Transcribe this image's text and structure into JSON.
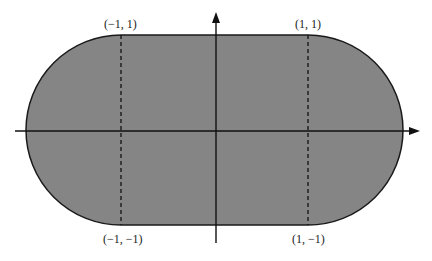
{
  "diagram": {
    "shape": "stadium",
    "fill_color": "#858585",
    "stroke_color": "#1a1a1a",
    "points": [
      {
        "id": "top-left",
        "label": "(−1, 1)",
        "x": -1,
        "y": 1
      },
      {
        "id": "top-right",
        "label": "(1, 1)",
        "x": 1,
        "y": 1
      },
      {
        "id": "bottom-left",
        "label": "(−1, −1)",
        "x": -1,
        "y": -1
      },
      {
        "id": "bottom-right",
        "label": "(1, −1)",
        "x": 1,
        "y": -1
      }
    ],
    "axes": {
      "x_arrow": true,
      "y_arrow": true
    },
    "dashed_lines": [
      "x = -1",
      "x = 1"
    ]
  }
}
